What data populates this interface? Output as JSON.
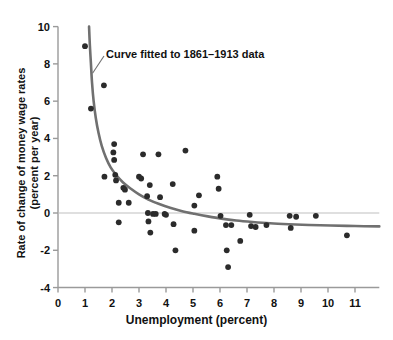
{
  "chart_data": {
    "type": "scatter",
    "title": "",
    "xlabel": "Unemployment (percent)",
    "ylabel": "Rate of change of money wage rates (percent per year)",
    "ylabel_line1": "Rate of change of money wage rates",
    "ylabel_line2": "(percent per year)",
    "xlim": [
      0,
      11.9
    ],
    "ylim": [
      -4,
      10
    ],
    "xticks": [
      0,
      1,
      2,
      3,
      4,
      5,
      6,
      7,
      8,
      9,
      10,
      11
    ],
    "xtick_labels": [
      "0",
      "1",
      "2",
      "3",
      "4",
      "5",
      "6",
      "7",
      "8",
      "9",
      "10",
      "11"
    ],
    "yticks": [
      -4,
      -2,
      0,
      2,
      4,
      6,
      8,
      10
    ],
    "ytick_labels": [
      "-4",
      "-2",
      "0",
      "2",
      "4",
      "6",
      "8",
      "10"
    ],
    "grid": false,
    "zero_line": true,
    "zero_line_value": 0,
    "legend": "none",
    "annotations": [
      {
        "text": "Curve fitted to 1861–1913 data",
        "x": 2.0,
        "y": 8.4,
        "points_to_x": 1.28,
        "points_to_y": 7.5
      }
    ],
    "series": [
      {
        "name": "Annual observations",
        "marker": "circle",
        "color": "#2b2b2b",
        "points": [
          [
            1.0,
            8.95
          ],
          [
            1.22,
            5.6
          ],
          [
            1.7,
            6.85
          ],
          [
            1.72,
            1.95
          ],
          [
            2.08,
            3.7
          ],
          [
            2.05,
            3.25
          ],
          [
            2.08,
            2.85
          ],
          [
            2.12,
            2.05
          ],
          [
            2.15,
            1.75
          ],
          [
            2.25,
            0.55
          ],
          [
            2.25,
            -0.5
          ],
          [
            2.42,
            1.35
          ],
          [
            2.48,
            1.25
          ],
          [
            2.62,
            0.55
          ],
          [
            3.0,
            1.95
          ],
          [
            3.08,
            1.85
          ],
          [
            3.15,
            3.15
          ],
          [
            3.3,
            0.9
          ],
          [
            3.33,
            0.0
          ],
          [
            3.35,
            -0.45
          ],
          [
            3.4,
            1.5
          ],
          [
            3.42,
            -1.05
          ],
          [
            3.52,
            -0.05
          ],
          [
            3.62,
            -0.05
          ],
          [
            3.72,
            3.15
          ],
          [
            3.78,
            0.85
          ],
          [
            3.95,
            -0.05
          ],
          [
            4.0,
            -0.1
          ],
          [
            4.25,
            1.55
          ],
          [
            4.28,
            -0.6
          ],
          [
            4.35,
            -2.0
          ],
          [
            4.72,
            3.35
          ],
          [
            5.05,
            0.4
          ],
          [
            5.05,
            -0.95
          ],
          [
            5.22,
            0.95
          ],
          [
            5.9,
            1.95
          ],
          [
            5.95,
            1.3
          ],
          [
            6.02,
            -0.15
          ],
          [
            6.22,
            -0.65
          ],
          [
            6.25,
            -2.0
          ],
          [
            6.3,
            -2.9
          ],
          [
            6.42,
            -0.65
          ],
          [
            6.75,
            -1.5
          ],
          [
            7.1,
            -0.1
          ],
          [
            7.15,
            -0.7
          ],
          [
            7.32,
            -0.75
          ],
          [
            7.72,
            -0.65
          ],
          [
            8.58,
            -0.15
          ],
          [
            8.62,
            -0.8
          ],
          [
            8.82,
            -0.2
          ],
          [
            9.55,
            -0.15
          ],
          [
            10.7,
            -1.2
          ]
        ]
      }
    ],
    "fitted_curve": {
      "name": "Phillips curve fit",
      "color": "#707070",
      "description": "Curve fitted to 1861–1913 data",
      "asymptote_y": -0.72,
      "points": [
        [
          1.15,
          10.0
        ],
        [
          1.18,
          9.0
        ],
        [
          1.22,
          8.0
        ],
        [
          1.26,
          7.0
        ],
        [
          1.32,
          6.0
        ],
        [
          1.4,
          5.1
        ],
        [
          1.5,
          4.3
        ],
        [
          1.62,
          3.6
        ],
        [
          1.78,
          2.95
        ],
        [
          1.95,
          2.45
        ],
        [
          2.15,
          2.05
        ],
        [
          2.4,
          1.65
        ],
        [
          2.7,
          1.3
        ],
        [
          3.0,
          1.0
        ],
        [
          3.35,
          0.72
        ],
        [
          3.75,
          0.48
        ],
        [
          4.15,
          0.28
        ],
        [
          4.6,
          0.1
        ],
        [
          5.05,
          -0.04
        ],
        [
          5.55,
          -0.18
        ],
        [
          6.05,
          -0.3
        ],
        [
          6.6,
          -0.4
        ],
        [
          7.2,
          -0.48
        ],
        [
          7.85,
          -0.55
        ],
        [
          8.55,
          -0.6
        ],
        [
          9.3,
          -0.64
        ],
        [
          10.1,
          -0.67
        ],
        [
          11.0,
          -0.7
        ],
        [
          11.9,
          -0.72
        ]
      ]
    }
  },
  "axes_geometry": {
    "x_pixel_at_zero": 58,
    "x_pixels_per_unit": 27.0,
    "y_pixel_at_zero": 213,
    "y_pixels_per_unit": 18.64,
    "axis_color": "#9a9a9a",
    "zero_line_color": "#bfbfbf",
    "background": "#ffffff"
  }
}
